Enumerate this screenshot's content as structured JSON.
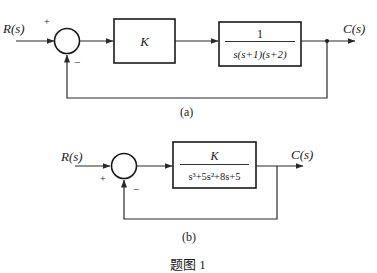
{
  "diagram_a": {
    "label": "(a)",
    "input_label": "R(s)",
    "output_label": "C(s)",
    "sum_signs": {
      "input": "+",
      "feedback": "−"
    },
    "block1": {
      "text": "K"
    },
    "block2": {
      "numerator": "1",
      "denominator": "s(s+1)(s+2)"
    }
  },
  "diagram_b": {
    "label": "(b)",
    "input_label": "R(s)",
    "output_label": "C(s)",
    "sum_signs": {
      "input": "+",
      "feedback": "−"
    },
    "block": {
      "numerator": "K",
      "denominator": "s³+5s²+8s+5"
    }
  },
  "figure_caption": "题图 1",
  "colors": {
    "line": "#2a2a2a",
    "background": "#ffffff"
  }
}
